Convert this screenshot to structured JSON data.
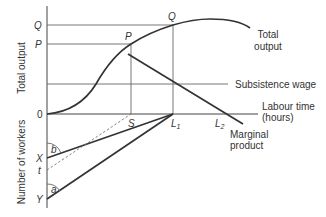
{
  "axes": {
    "top_y_label": "Total output",
    "bottom_y_label": "Number of workers",
    "x_label_line1": "Labour time",
    "x_label_line2": "(hours)",
    "origin": "0"
  },
  "y_marks": {
    "q": "Q",
    "p": "P",
    "x": "X",
    "t": "t",
    "y": "Y"
  },
  "points": {
    "q": "Q",
    "p": "P",
    "s": "S",
    "l1": "L",
    "l1_sub": "1",
    "l2": "L",
    "l2_sub": "2"
  },
  "curves": {
    "total_output_line1": "Total",
    "total_output_line2": "output",
    "subsistence": "Subsistence wage",
    "marginal_line1": "Marginal",
    "marginal_line2": "product"
  },
  "angles": {
    "a": "a",
    "b": "b"
  }
}
